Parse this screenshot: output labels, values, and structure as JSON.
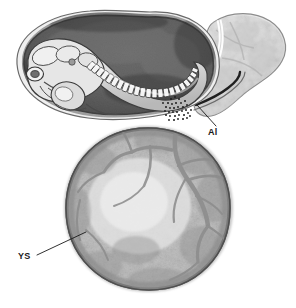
{
  "figure": {
    "name": "embryo-yolk-sac-allantois-illustration",
    "type": "halftone-anatomical-illustration",
    "background_color": "#ffffff",
    "width": 296,
    "height": 308
  },
  "labels": [
    {
      "id": "al",
      "text": "Al",
      "meaning": "allantois",
      "x": 208,
      "y": 128,
      "leader_from": [
        216,
        126
      ],
      "leader_to": [
        196,
        104
      ],
      "color": "#1a1a1a"
    },
    {
      "id": "ys",
      "text": "YS",
      "meaning": "yolk sac",
      "x": 18,
      "y": 252,
      "leader_from": [
        36,
        254
      ],
      "leader_to": [
        86,
        232
      ],
      "color": "#1a1a1a"
    }
  ],
  "structures": {
    "amniotic_cavity": {
      "label": "amniotic cavity",
      "fill": "#6e6e6e",
      "stroke": "#2b2b2b"
    },
    "amnion_membrane": {
      "label": "amnion membrane",
      "fill": "#f0f0f0",
      "stroke": "#5a5a5a"
    },
    "embryo": {
      "label": "embryo",
      "fill": "#e4e4e4",
      "stroke": "#4a4a4a"
    },
    "somites": {
      "label": "somites",
      "fill": "#f2f2f2",
      "stroke": "#3c3c3c",
      "count": 22
    },
    "allantois": {
      "label": "allantois",
      "fill": "#e3e3e3",
      "stroke": "#8d8d8d"
    },
    "yolk_sac": {
      "label": "yolk sac",
      "fill_center": "#dcdcdc",
      "fill_rim": "#8f8f8f",
      "stroke": "#555555"
    },
    "vitelline_vessels": {
      "label": "vitelline vessels",
      "stroke": "#8c8c8c"
    },
    "stippled_junction": {
      "label": "stippled junction region",
      "color": "#1f1f1f"
    }
  },
  "palette": {
    "background": "#ffffff",
    "darkest": "#232323",
    "dark_gray": "#4a4a4a",
    "mid_gray": "#6e6e6e",
    "light_gray": "#b4b4b4",
    "lightest_gray": "#e8e8e8",
    "label_text": "#1a1a1a"
  }
}
